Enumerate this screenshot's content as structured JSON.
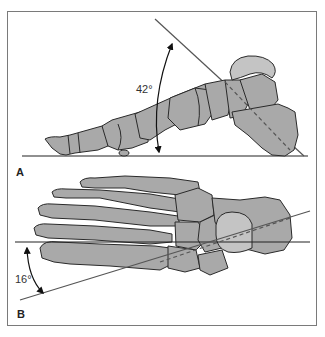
{
  "figure": {
    "panels": [
      {
        "id": "A",
        "label": "A",
        "view": "lateral view of foot skeleton",
        "angle_label": "42°",
        "angle_value_deg": 42,
        "lines": [
          "horizontal ground line",
          "inclined line along talus/calcaneus axis"
        ]
      },
      {
        "id": "B",
        "label": "B",
        "view": "dorsal view of foot skeleton",
        "angle_label": "16°",
        "angle_value_deg": 16,
        "lines": [
          "horizontal reference line",
          "inclined line along talar axis"
        ]
      }
    ],
    "colors": {
      "bone_fill": "#a9a9a9",
      "bone_light": "#c4c4c4",
      "outline": "#2a2a2a",
      "line": "#555555",
      "frame": "#7a7a7a"
    }
  }
}
